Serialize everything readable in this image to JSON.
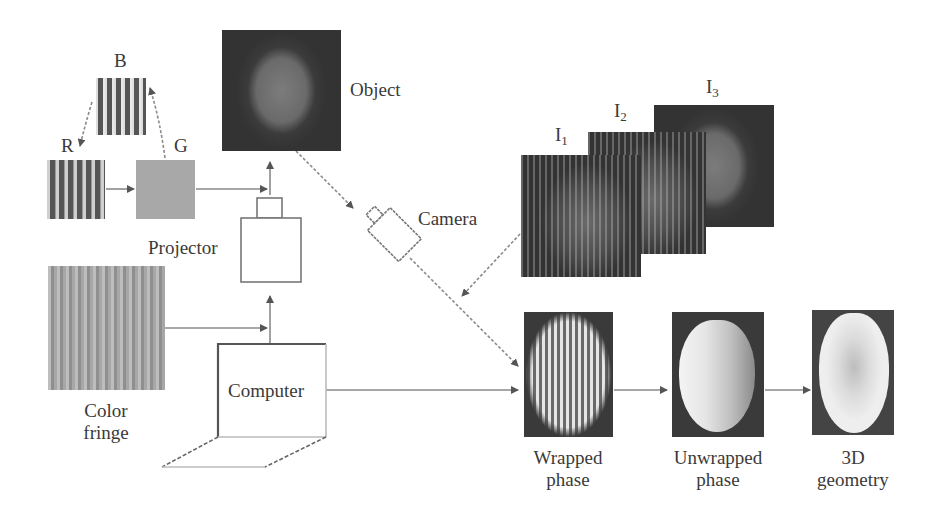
{
  "diagram": {
    "colors": {
      "line": "#8a8a8a",
      "arrow": "#555555",
      "text": "#3a3a3a"
    },
    "labels": {
      "b": "B",
      "r": "R",
      "g": "G",
      "object": "Object",
      "projector": "Projector",
      "camera": "Camera",
      "computer": "Computer",
      "color_fringe_line1": "Color",
      "color_fringe_line2": "fringe",
      "i1_base": "I",
      "i1_sub": "1",
      "i2_base": "I",
      "i2_sub": "2",
      "i3_base": "I",
      "i3_sub": "3",
      "wrapped_line1": "Wrapped",
      "wrapped_line2": "phase",
      "unwrapped_line1": "Unwrapped",
      "unwrapped_line2": "phase",
      "geometry_line1": "3D",
      "geometry_line2": "geometry"
    },
    "nodes": [
      {
        "id": "b-channel",
        "kind": "stripe-pattern"
      },
      {
        "id": "r-channel",
        "kind": "stripe-pattern"
      },
      {
        "id": "g-channel",
        "kind": "solid"
      },
      {
        "id": "color-fringe",
        "kind": "stripe-pattern"
      },
      {
        "id": "projector",
        "kind": "device"
      },
      {
        "id": "object",
        "kind": "photo"
      },
      {
        "id": "camera",
        "kind": "device"
      },
      {
        "id": "computer",
        "kind": "device"
      },
      {
        "id": "captured-i1",
        "kind": "photo"
      },
      {
        "id": "captured-i2",
        "kind": "photo"
      },
      {
        "id": "captured-i3",
        "kind": "photo"
      },
      {
        "id": "wrapped-phase",
        "kind": "result"
      },
      {
        "id": "unwrapped-phase",
        "kind": "result"
      },
      {
        "id": "3d-geometry",
        "kind": "result"
      }
    ],
    "edges": [
      [
        "g-channel",
        "b-channel"
      ],
      [
        "b-channel",
        "r-channel"
      ],
      [
        "r-channel",
        "g-channel"
      ],
      [
        "g-channel",
        "projector"
      ],
      [
        "color-fringe",
        "projector"
      ],
      [
        "computer",
        "projector"
      ],
      [
        "projector",
        "object"
      ],
      [
        "object",
        "camera"
      ],
      [
        "camera",
        "wrapped-phase"
      ],
      [
        "captured-i1",
        "wrapped-phase"
      ],
      [
        "computer",
        "wrapped-phase"
      ],
      [
        "wrapped-phase",
        "unwrapped-phase"
      ],
      [
        "unwrapped-phase",
        "3d-geometry"
      ]
    ]
  }
}
